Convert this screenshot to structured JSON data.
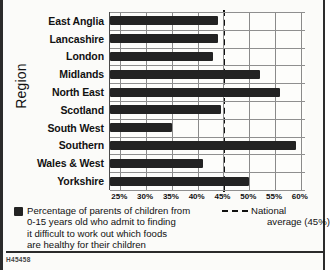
{
  "chart_data": {
    "type": "bar",
    "orientation": "horizontal",
    "title": "",
    "xlabel": "",
    "ylabel": "Region",
    "categories": [
      "East Anglia",
      "Lancashire",
      "London",
      "Midlands",
      "North East",
      "Scotland",
      "South West",
      "Southern",
      "Wales & West",
      "Yorkshire"
    ],
    "values": [
      44,
      44,
      43,
      52,
      56,
      44.5,
      35,
      59,
      41,
      50
    ],
    "xlim": [
      23,
      61
    ],
    "xticks": [
      25,
      30,
      35,
      40,
      45,
      50,
      55,
      60
    ],
    "xtick_labels": [
      "25%",
      "30%",
      "35%",
      "40%",
      "45%",
      "50%",
      "55%",
      "60%"
    ],
    "grid": true,
    "legend_position": "below",
    "series_name": "Percentage of parents of children from 0-15 years old who admit to finding it difficult to work out which foods are healthy for their children",
    "annotations": [
      {
        "name": "national-average",
        "type": "vline",
        "value": 45,
        "label": "National average (45%)",
        "style": "dashed"
      }
    ],
    "bar_color": "#232323"
  },
  "axis": {
    "y_title": "Region"
  },
  "legend": {
    "series_line1": "Percentage of parents of children from",
    "series_line2": "0-15 years old who admit to finding",
    "series_line3": "it difficult to work out which foods",
    "series_line4": "are healthy for their children",
    "average_line1": "National",
    "average_line2": "average (45%)"
  },
  "footer": {
    "reference_code": "H45458"
  }
}
